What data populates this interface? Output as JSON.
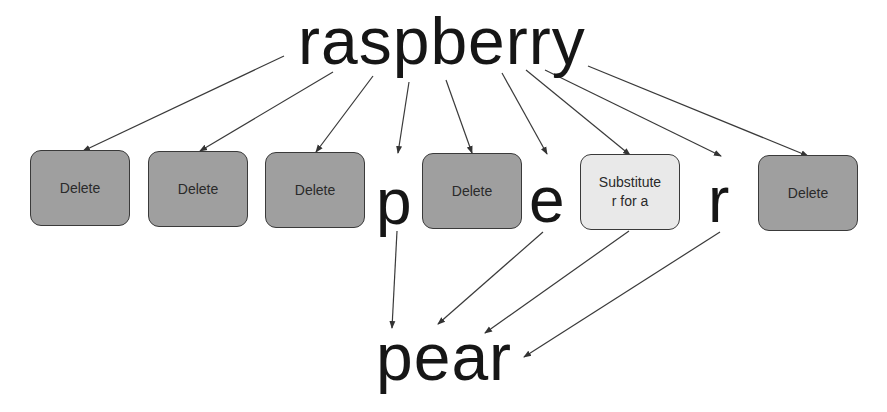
{
  "source_word": "raspberry",
  "target_word": "pear",
  "colors": {
    "delete_box": "#9f9f9f",
    "substitute_box": "#e9e9e9",
    "arrow": "#333333",
    "text": "#161616"
  },
  "operations": [
    {
      "type": "delete",
      "label": "Delete"
    },
    {
      "type": "delete",
      "label": "Delete"
    },
    {
      "type": "delete",
      "label": "Delete"
    },
    {
      "type": "keep",
      "label": "p"
    },
    {
      "type": "delete",
      "label": "Delete"
    },
    {
      "type": "keep",
      "label": "e"
    },
    {
      "type": "substitute",
      "label_line1": "Substitute",
      "label_line2": "r for a"
    },
    {
      "type": "keep",
      "label": "r"
    },
    {
      "type": "delete",
      "label": "Delete"
    }
  ]
}
